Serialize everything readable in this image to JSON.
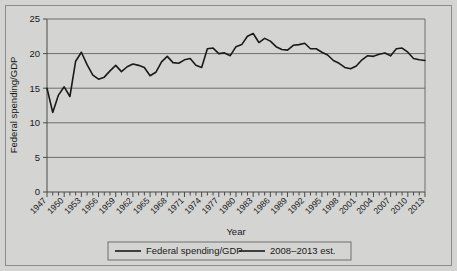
{
  "chart_data": {
    "type": "line",
    "title": "",
    "xlabel": "Year",
    "ylabel": "Federal spending/GDP",
    "xlim": [
      1947,
      2013
    ],
    "ylim": [
      0,
      25
    ],
    "yticks": [
      0,
      5,
      10,
      15,
      20,
      25
    ],
    "xticks": [
      1947,
      1950,
      1953,
      1956,
      1959,
      1962,
      1965,
      1968,
      1971,
      1974,
      1977,
      1980,
      1983,
      1986,
      1989,
      1992,
      1995,
      1998,
      2001,
      2004,
      2007,
      2010,
      2013
    ],
    "grid": true,
    "grid_axis": "y",
    "legend_position": "bottom",
    "line_color": "#1a1a1a",
    "plot_background": "#d4d4d2",
    "series": [
      {
        "name": "Federal spending/GDP",
        "x": [
          1947,
          1948,
          1949,
          1950,
          1951,
          1952,
          1953,
          1954,
          1955,
          1956,
          1957,
          1958,
          1959,
          1960,
          1961,
          1962,
          1963,
          1964,
          1965,
          1966,
          1967,
          1968,
          1969,
          1970,
          1971,
          1972,
          1973,
          1974,
          1975,
          1976,
          1977,
          1978,
          1979,
          1980,
          1981,
          1982,
          1983,
          1984,
          1985,
          1986,
          1987,
          1988,
          1989,
          1990,
          1991,
          1992,
          1993,
          1994,
          1995,
          1996,
          1997,
          1998,
          1999,
          2000,
          2001,
          2002,
          2003,
          2004,
          2005,
          2006,
          2007
        ],
        "values": [
          15.0,
          11.5,
          14.0,
          15.2,
          13.8,
          18.9,
          20.2,
          18.4,
          16.9,
          16.3,
          16.6,
          17.5,
          18.3,
          17.4,
          18.1,
          18.5,
          18.3,
          18.0,
          16.8,
          17.3,
          18.8,
          19.6,
          18.7,
          18.6,
          19.1,
          19.3,
          18.3,
          18.0,
          20.7,
          20.8,
          20.0,
          20.1,
          19.7,
          21.0,
          21.3,
          22.5,
          22.9,
          21.6,
          22.2,
          21.8,
          21.0,
          20.6,
          20.5,
          21.2,
          21.3,
          21.5,
          20.7,
          20.7,
          20.2,
          19.8,
          19.0,
          18.6,
          18.0,
          17.8,
          18.2,
          19.1,
          19.7,
          19.6,
          19.9,
          20.1,
          19.7
        ]
      },
      {
        "name": "2008–2013 est.",
        "x": [
          2007,
          2008,
          2009,
          2010,
          2011,
          2012,
          2013
        ],
        "values": [
          19.7,
          20.7,
          20.8,
          20.2,
          19.3,
          19.1,
          19.0
        ]
      }
    ]
  },
  "legend": {
    "items": [
      {
        "label": "Federal spending/GDP",
        "color": "#1a1a1a"
      },
      {
        "label": "2008–2013 est.",
        "color": "#1a1a1a"
      }
    ]
  },
  "axes": {
    "y_title": "Federal spending/GDP",
    "x_title": "Year"
  }
}
